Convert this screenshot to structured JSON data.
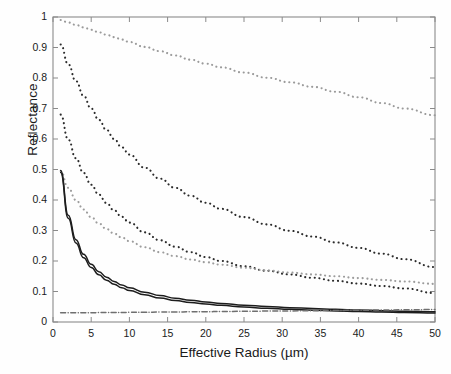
{
  "chart_data": {
    "type": "line",
    "title": "",
    "xlabel": "Effective Radius (µm)",
    "ylabel": "Reflectance",
    "xlim": [
      0,
      50
    ],
    "ylim": [
      0,
      1
    ],
    "grid": false,
    "legend": "none",
    "xticks": [
      "0",
      "5",
      "10",
      "15",
      "20",
      "25",
      "30",
      "35",
      "40",
      "45",
      "50"
    ],
    "yticks": [
      "0",
      "0.1",
      "0.2",
      "0.3",
      "0.4",
      "0.5",
      "0.6",
      "0.7",
      "0.8",
      "0.9",
      "1"
    ],
    "x": [
      1,
      2,
      3,
      4,
      5,
      6,
      7,
      8,
      9,
      10,
      12,
      14,
      16,
      18,
      20,
      22,
      25,
      28,
      31,
      34,
      37,
      40,
      43,
      46,
      50
    ],
    "series": [
      {
        "name": "curve-1-light-dotted-upper",
        "style": "dotted",
        "color": "#9a9a9a",
        "values": [
          0.99,
          0.982,
          0.974,
          0.966,
          0.958,
          0.95,
          0.942,
          0.934,
          0.926,
          0.918,
          0.902,
          0.888,
          0.874,
          0.86,
          0.847,
          0.835,
          0.818,
          0.801,
          0.786,
          0.771,
          0.755,
          0.737,
          0.718,
          0.7,
          0.678
        ]
      },
      {
        "name": "curve-2-dark-dotted",
        "style": "dotted",
        "color": "#2b2b2b",
        "values": [
          0.91,
          0.845,
          0.79,
          0.742,
          0.7,
          0.663,
          0.63,
          0.6,
          0.573,
          0.549,
          0.506,
          0.47,
          0.44,
          0.414,
          0.391,
          0.371,
          0.344,
          0.32,
          0.299,
          0.28,
          0.261,
          0.243,
          0.224,
          0.206,
          0.18
        ]
      },
      {
        "name": "curve-3-dark-dotted-lower",
        "style": "dotted",
        "color": "#2b2b2b",
        "values": [
          0.68,
          0.598,
          0.537,
          0.489,
          0.45,
          0.418,
          0.39,
          0.366,
          0.345,
          0.326,
          0.294,
          0.268,
          0.247,
          0.229,
          0.213,
          0.2,
          0.183,
          0.168,
          0.156,
          0.145,
          0.135,
          0.126,
          0.118,
          0.11,
          0.095
        ]
      },
      {
        "name": "curve-4-light-dotted-crossing",
        "style": "dotted",
        "color": "#9c9c9c",
        "values": [
          0.495,
          0.44,
          0.4,
          0.369,
          0.344,
          0.323,
          0.305,
          0.29,
          0.277,
          0.265,
          0.245,
          0.229,
          0.216,
          0.205,
          0.196,
          0.188,
          0.178,
          0.169,
          0.162,
          0.156,
          0.15,
          0.144,
          0.138,
          0.133,
          0.125
        ]
      },
      {
        "name": "curve-5-solid-upper",
        "style": "solid",
        "color": "#1d1d1d",
        "values": [
          0.497,
          0.35,
          0.27,
          0.222,
          0.189,
          0.165,
          0.147,
          0.133,
          0.121,
          0.112,
          0.0975,
          0.0866,
          0.0781,
          0.0713,
          0.0657,
          0.061,
          0.0553,
          0.0508,
          0.0471,
          0.044,
          0.0414,
          0.0392,
          0.0372,
          0.0355,
          0.0335
        ]
      },
      {
        "name": "curve-6-solid-lower",
        "style": "solid",
        "color": "#1d1d1d",
        "values": [
          0.49,
          0.34,
          0.259,
          0.211,
          0.179,
          0.155,
          0.137,
          0.124,
          0.112,
          0.103,
          0.089,
          0.0786,
          0.0706,
          0.0642,
          0.059,
          0.0546,
          0.0492,
          0.045,
          0.0416,
          0.0388,
          0.0364,
          0.0344,
          0.0326,
          0.0311,
          0.0293
        ]
      },
      {
        "name": "curve-7-flat-dashdot",
        "style": "dashdot",
        "color": "#6f6f6f",
        "values": [
          0.03,
          0.0301,
          0.0302,
          0.0304,
          0.0306,
          0.0308,
          0.031,
          0.0312,
          0.0314,
          0.0316,
          0.032,
          0.0325,
          0.0329,
          0.0334,
          0.0338,
          0.0343,
          0.035,
          0.0357,
          0.0364,
          0.0371,
          0.0378,
          0.0385,
          0.0392,
          0.0399,
          0.0408
        ]
      }
    ]
  },
  "axes": {
    "plot_box": {
      "left": 53,
      "top": 17,
      "right": 435,
      "bottom": 322
    },
    "frame_color": "#8a8a8a"
  }
}
